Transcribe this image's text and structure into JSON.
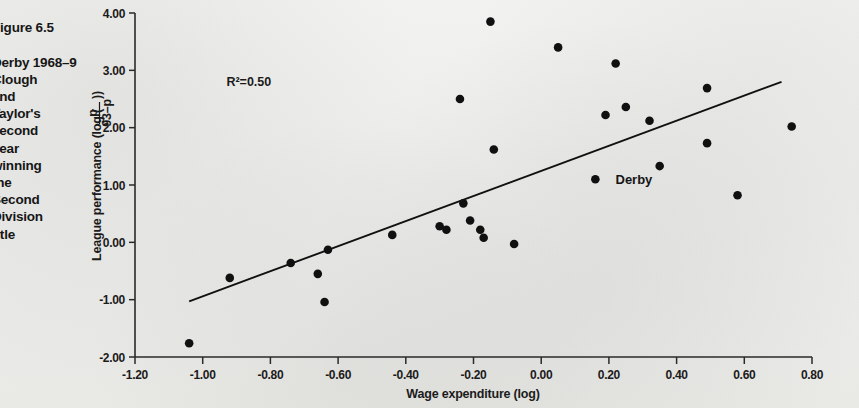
{
  "figure": {
    "caption_title": "Figure 6.5",
    "caption_body": "Derby 1968–9\nClough\nand\nTaylor's\nsecond\nyear\nwinning\nthe\nSecond\nDivision\ntitle"
  },
  "colors": {
    "paper": "#eeeeec",
    "ink": "#1a1a1a",
    "axis": "#2a2a2a",
    "marker": "#101010",
    "trendline": "#111111"
  },
  "chart_data": {
    "type": "scatter",
    "title": "",
    "xlabel": "Wage expenditure (log)",
    "ylabel": "League performance (log ( p / (93-p) ))",
    "ylabel_parts": {
      "prefix": "League performance (log (",
      "numerator": "p",
      "denominator": "93–p",
      "suffix": "))"
    },
    "xlim": [
      -1.2,
      0.8
    ],
    "ylim": [
      -2.0,
      4.0
    ],
    "xticks": [
      -1.2,
      -1.0,
      -0.8,
      -0.6,
      -0.4,
      -0.2,
      0.0,
      0.2,
      0.4,
      0.6,
      0.8
    ],
    "xtick_labels": [
      "-1.20",
      "-1.00",
      "-0.80",
      "-0.60",
      "-0.40",
      "-0.20",
      "0.00",
      "0.20",
      "0.40",
      "0.60",
      "0.80"
    ],
    "yticks": [
      -2.0,
      -1.0,
      0.0,
      1.0,
      2.0,
      3.0,
      4.0
    ],
    "ytick_labels": [
      "-2.00",
      "-1.00",
      "0.00",
      "1.00",
      "2.00",
      "3.00",
      "4.00"
    ],
    "grid": false,
    "legend": "none",
    "annotations": [
      {
        "text": "R²=0.50",
        "x": -0.93,
        "y": 2.72,
        "name": "r-squared-annotation"
      }
    ],
    "point_labels": [
      {
        "text": "Derby",
        "x": 0.19,
        "y": 1.1,
        "name": "derby-point-label"
      }
    ],
    "trendline": {
      "x0": -1.04,
      "y0": -1.03,
      "x1": 0.71,
      "y1": 2.8,
      "r_squared": 0.5
    },
    "points": [
      {
        "x": -1.04,
        "y": -1.76
      },
      {
        "x": -0.92,
        "y": -0.62
      },
      {
        "x": -0.74,
        "y": -0.36
      },
      {
        "x": -0.66,
        "y": -0.55
      },
      {
        "x": -0.64,
        "y": -1.04
      },
      {
        "x": -0.63,
        "y": -0.13
      },
      {
        "x": -0.44,
        "y": 0.13
      },
      {
        "x": -0.3,
        "y": 0.28
      },
      {
        "x": -0.28,
        "y": 0.22
      },
      {
        "x": -0.24,
        "y": 2.5
      },
      {
        "x": -0.23,
        "y": 0.68
      },
      {
        "x": -0.21,
        "y": 0.38
      },
      {
        "x": -0.18,
        "y": 0.22
      },
      {
        "x": -0.17,
        "y": 0.08
      },
      {
        "x": -0.15,
        "y": 3.85
      },
      {
        "x": -0.14,
        "y": 1.62
      },
      {
        "x": -0.08,
        "y": -0.03
      },
      {
        "x": 0.05,
        "y": 3.4
      },
      {
        "x": 0.16,
        "y": 1.1
      },
      {
        "x": 0.19,
        "y": 2.22
      },
      {
        "x": 0.22,
        "y": 3.12
      },
      {
        "x": 0.25,
        "y": 2.36
      },
      {
        "x": 0.32,
        "y": 2.12
      },
      {
        "x": 0.35,
        "y": 1.33
      },
      {
        "x": 0.49,
        "y": 2.69
      },
      {
        "x": 0.49,
        "y": 1.73
      },
      {
        "x": 0.58,
        "y": 0.82
      },
      {
        "x": 0.74,
        "y": 2.02
      }
    ]
  }
}
